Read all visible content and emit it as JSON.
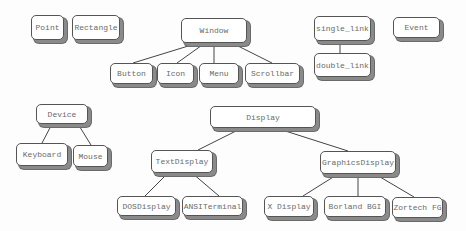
{
  "nodes": {
    "point": "Point",
    "rectangle": "Rectangle",
    "window": "Window",
    "button": "Button",
    "icon": "Icon",
    "menu": "Menu",
    "scrollbar": "Scrollbar",
    "single_link": "single_link",
    "double_link": "double_link",
    "event": "Event",
    "device": "Device",
    "keyboard": "Keyboard",
    "mouse": "Mouse",
    "display": "Display",
    "text_display": "TextDisplay",
    "graphics_display": "GraphicsDisplay",
    "dos_display": "DOSDisplay",
    "ansi_terminal": "ANSITerminal",
    "x_display": "X Display",
    "borland_bgi": "Borland BGI",
    "zortech_fg": "Zortech FG"
  },
  "edges": [
    [
      "Window",
      "Button"
    ],
    [
      "Window",
      "Icon"
    ],
    [
      "Window",
      "Menu"
    ],
    [
      "Window",
      "Scrollbar"
    ],
    [
      "single_link",
      "double_link"
    ],
    [
      "Device",
      "Keyboard"
    ],
    [
      "Device",
      "Mouse"
    ],
    [
      "Display",
      "TextDisplay"
    ],
    [
      "Display",
      "GraphicsDisplay"
    ],
    [
      "TextDisplay",
      "DOSDisplay"
    ],
    [
      "TextDisplay",
      "ANSITerminal"
    ],
    [
      "GraphicsDisplay",
      "X Display"
    ],
    [
      "GraphicsDisplay",
      "Borland BGI"
    ],
    [
      "GraphicsDisplay",
      "Zortech FG"
    ]
  ]
}
